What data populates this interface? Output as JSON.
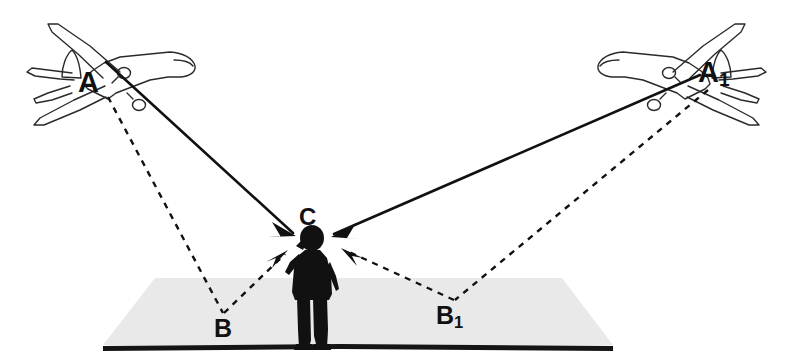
{
  "diagram": {
    "background_color": "#ffffff",
    "ground_color": "#e9e9e9",
    "line_color": "#111111",
    "labels": {
      "aircraft_left": "A",
      "aircraft_right_base": "A",
      "aircraft_right_sub": "1",
      "listener": "C",
      "reflection_left": "B",
      "reflection_right_base": "B",
      "reflection_right_sub": "1"
    },
    "icons": {
      "aircraft_left": "airplane-outline-icon",
      "aircraft_right": "airplane-outline-icon",
      "listener": "person-listening-silhouette-icon",
      "ground": "ground-plane-icon"
    },
    "paths": [
      {
        "name": "direct-path-a-to-c",
        "from": "A",
        "to": "C",
        "style": "solid",
        "arrow": "at-c"
      },
      {
        "name": "direct-path-a1-to-c",
        "from": "A1",
        "to": "C",
        "style": "solid",
        "arrow": "at-c"
      },
      {
        "name": "incident-path-a-to-b",
        "from": "A",
        "to": "B",
        "style": "dashed",
        "arrow": "none"
      },
      {
        "name": "reflected-path-b-to-c",
        "from": "B",
        "to": "C",
        "style": "dashed",
        "arrow": "at-c"
      },
      {
        "name": "incident-path-a1-to-b1",
        "from": "A1",
        "to": "B1",
        "style": "dashed",
        "arrow": "none"
      },
      {
        "name": "reflected-path-b1-to-c",
        "from": "B1",
        "to": "C",
        "style": "dashed",
        "arrow": "at-c"
      }
    ]
  }
}
